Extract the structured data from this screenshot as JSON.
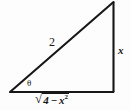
{
  "figure": {
    "name": "right-triangle-trig-diagram",
    "background_color": "#fdfdfd",
    "stroke_color": "#171717"
  },
  "labels": {
    "hypotenuse": "2",
    "opposite_side": "x",
    "angle": "θ",
    "adjacent_radical_sign": "√",
    "adjacent_radicand_number": "4",
    "adjacent_radicand_operator": "−",
    "adjacent_radicand_variable": "x",
    "adjacent_radicand_exponent": "2",
    "adjacent_full": "√(4 − x²)"
  },
  "geometry": {
    "vertex_bottom_left": [
      10,
      92
    ],
    "vertex_bottom_right": [
      114,
      92
    ],
    "vertex_top_right": [
      114,
      2
    ],
    "base_length_label": "√(4 − x²)",
    "height_label": "x",
    "hypotenuse_label": "2",
    "angle_label": "θ",
    "right_angle_at": "bottom-right"
  }
}
